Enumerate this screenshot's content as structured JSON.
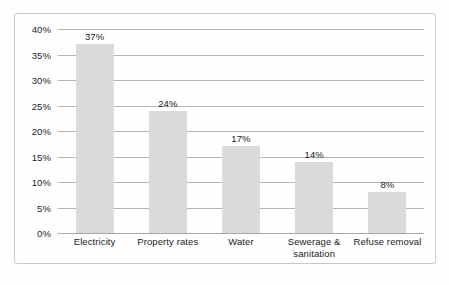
{
  "chart_data": {
    "type": "bar",
    "title": "",
    "subtitle": "",
    "xlabel": "",
    "ylabel": "",
    "ylim": [
      0,
      40
    ],
    "grid": true,
    "legend": false,
    "legend_position": "none",
    "value_suffix": "%",
    "categories": [
      "Electricity",
      "Property rates",
      "Water",
      "Sewerage & sanitation",
      "Refuse removal"
    ],
    "category_lines": [
      [
        "Electricity"
      ],
      [
        "Property rates"
      ],
      [
        "Water"
      ],
      [
        "Sewerage &",
        "sanitation"
      ],
      [
        "Refuse removal"
      ]
    ],
    "values": [
      37,
      24,
      17,
      14,
      8
    ],
    "value_labels": [
      "37%",
      "24%",
      "17%",
      "14%",
      "8%"
    ],
    "ytick_values": [
      0,
      5,
      10,
      15,
      20,
      25,
      30,
      35,
      40
    ],
    "ytick_labels": [
      "0%",
      "5%",
      "10%",
      "15%",
      "20%",
      "25%",
      "30%",
      "35%",
      "40%"
    ],
    "colors": {
      "bar_fill": "#dadada",
      "gridline": "#b5b5b5",
      "axis_line": "#a8a8a8",
      "text": "#1a1a1a",
      "frame_border": "#c8c8c8",
      "background": "#ffffff"
    }
  }
}
